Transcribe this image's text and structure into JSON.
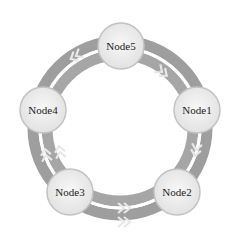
{
  "diagram": {
    "type": "dual-ring-topology",
    "center": {
      "x": 120,
      "y": 128
    },
    "ring_radius": 80,
    "colors": {
      "outer_ring": "#9a9a9a",
      "inner_ring": "#a8a8a8",
      "chevron": "#e6e6e6",
      "node_fill": "#efefef",
      "node_stroke": "#c4c4c4",
      "background": "#ffffff"
    },
    "nodes": [
      {
        "id": "n5",
        "label": "Node5",
        "x": 121,
        "y": 46
      },
      {
        "id": "n1",
        "label": "Node1",
        "x": 197,
        "y": 110
      },
      {
        "id": "n2",
        "label": "Node2",
        "x": 177,
        "y": 192
      },
      {
        "id": "n3",
        "label": "Node3",
        "x": 70,
        "y": 192
      },
      {
        "id": "n4",
        "label": "Node4",
        "x": 43,
        "y": 110
      }
    ],
    "links": [
      {
        "from": "Node5",
        "to": "Node1"
      },
      {
        "from": "Node1",
        "to": "Node2"
      },
      {
        "from": "Node2",
        "to": "Node3"
      },
      {
        "from": "Node3",
        "to": "Node4"
      },
      {
        "from": "Node4",
        "to": "Node5"
      }
    ]
  }
}
